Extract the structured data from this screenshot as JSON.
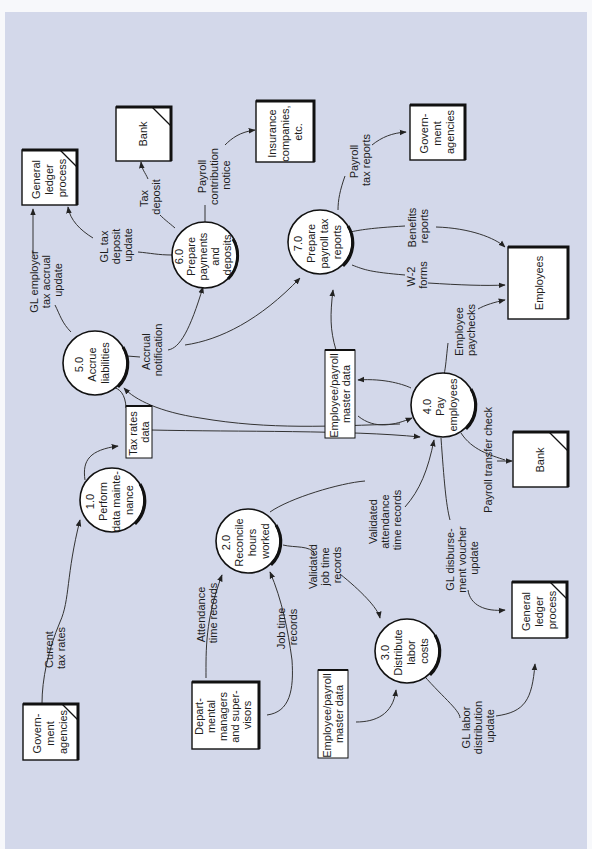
{
  "diagram": {
    "type": "data-flow-diagram",
    "orientation": "rotated-90-ccw",
    "background_color": "#d3d8ea",
    "processes": [
      {
        "id": "1.0",
        "lines": [
          "1.0",
          "Perform",
          "data mainte-",
          "nance"
        ]
      },
      {
        "id": "2.0",
        "lines": [
          "2.0",
          "Reconcile",
          "hours",
          "worked"
        ]
      },
      {
        "id": "3.0",
        "lines": [
          "3.0",
          "Distribute",
          "labor",
          "costs"
        ]
      },
      {
        "id": "4.0",
        "lines": [
          "4.0",
          "Pay",
          "employees"
        ]
      },
      {
        "id": "5.0",
        "lines": [
          "5.0",
          "Accrue",
          "liabilities"
        ]
      },
      {
        "id": "6.0",
        "lines": [
          "6.0",
          "Prepare",
          "payments",
          "and",
          "deposits"
        ]
      },
      {
        "id": "7.0",
        "lines": [
          "7.0",
          "Prepare",
          "payroll tax",
          "reports"
        ]
      }
    ],
    "entities": [
      {
        "id": "gov_left",
        "lines": [
          "Govern-",
          "ment",
          "agencies"
        ],
        "duplicate": true
      },
      {
        "id": "dept_mgrs",
        "lines": [
          "Depart-",
          "mental",
          "managers",
          "and super-",
          "visors"
        ],
        "duplicate": false
      },
      {
        "id": "gl_top",
        "lines": [
          "General",
          "ledger",
          "process"
        ],
        "duplicate": true
      },
      {
        "id": "bank_top",
        "lines": [
          "Bank"
        ],
        "duplicate": true
      },
      {
        "id": "insurance",
        "lines": [
          "Insurance",
          "companies,",
          "etc."
        ],
        "duplicate": false
      },
      {
        "id": "gov_right",
        "lines": [
          "Govern-",
          "ment",
          "agencies"
        ],
        "duplicate": false
      },
      {
        "id": "employees",
        "lines": [
          "Employees"
        ],
        "duplicate": false
      },
      {
        "id": "bank_right",
        "lines": [
          "Bank"
        ],
        "duplicate": true
      },
      {
        "id": "gl_right",
        "lines": [
          "General",
          "ledger",
          "process"
        ],
        "duplicate": true
      }
    ],
    "data_stores": [
      {
        "id": "tax_rates",
        "lines": [
          "Tax rates",
          "data"
        ]
      },
      {
        "id": "emp_master_top",
        "lines": [
          "Employee/payroll",
          "master data"
        ]
      },
      {
        "id": "emp_master_bottom",
        "lines": [
          "Employee/payroll",
          "master data"
        ]
      }
    ],
    "flows": [
      {
        "id": "f1",
        "lines": [
          "Current",
          "tax rates"
        ]
      },
      {
        "id": "f2",
        "lines": [
          "Attendance",
          "time records"
        ]
      },
      {
        "id": "f3",
        "lines": [
          "Job time",
          "records"
        ]
      },
      {
        "id": "f4",
        "lines": [
          "Validated",
          "attendance",
          "time records"
        ]
      },
      {
        "id": "f5",
        "lines": [
          "Validated",
          "job time",
          "records"
        ]
      },
      {
        "id": "f6",
        "lines": [
          "GL labor",
          "distribution",
          "update"
        ]
      },
      {
        "id": "f7",
        "lines": [
          "GL disburse-",
          "ment voucher",
          "update"
        ]
      },
      {
        "id": "f8",
        "lines": [
          "Payroll transfer check"
        ]
      },
      {
        "id": "f9",
        "lines": [
          "Employee",
          "paychecks"
        ]
      },
      {
        "id": "f10",
        "lines": [
          "W-2",
          "forms"
        ]
      },
      {
        "id": "f11",
        "lines": [
          "Benefits",
          "reports"
        ]
      },
      {
        "id": "f12",
        "lines": [
          "Payroll",
          "tax reports"
        ]
      },
      {
        "id": "f13",
        "lines": [
          "Accrual",
          "notification"
        ]
      },
      {
        "id": "f14",
        "lines": [
          "GL employer",
          "tax accrual",
          "update"
        ]
      },
      {
        "id": "f15",
        "lines": [
          "GL tax",
          "deposit",
          "update"
        ]
      },
      {
        "id": "f16",
        "lines": [
          "Tax",
          "deposit"
        ]
      },
      {
        "id": "f17",
        "lines": [
          "Payroll",
          "contribution",
          "notice"
        ]
      }
    ]
  }
}
